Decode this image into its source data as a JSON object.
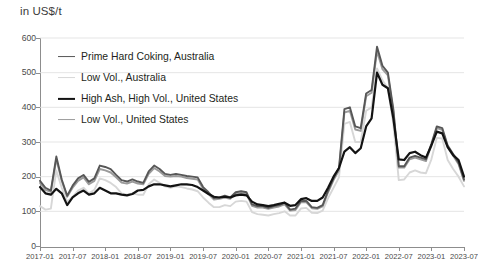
{
  "chart_data": {
    "type": "line",
    "title": "in US$/t",
    "xlabel": "",
    "ylabel": "in US$/t",
    "ylim": [
      0,
      600
    ],
    "ytick_step": 100,
    "yticks": [
      0,
      100,
      200,
      300,
      400,
      500,
      600
    ],
    "grid": true,
    "grid_axis": "y",
    "legend_position": "upper-left-inside",
    "x_tick_labels": [
      "2017-01",
      "2017-07",
      "2018-01",
      "2018-07",
      "2019-01",
      "2019-07",
      "2020-01",
      "2020-07",
      "2021-01",
      "2021-07",
      "2022-01",
      "2022-07",
      "2023-01",
      "2023-07"
    ],
    "x": [
      "2017-01",
      "2017-02",
      "2017-03",
      "2017-04",
      "2017-05",
      "2017-06",
      "2017-07",
      "2017-08",
      "2017-09",
      "2017-10",
      "2017-11",
      "2017-12",
      "2018-01",
      "2018-02",
      "2018-03",
      "2018-04",
      "2018-05",
      "2018-06",
      "2018-07",
      "2018-08",
      "2018-09",
      "2018-10",
      "2018-11",
      "2018-12",
      "2019-01",
      "2019-02",
      "2019-03",
      "2019-04",
      "2019-05",
      "2019-06",
      "2019-07",
      "2019-08",
      "2019-09",
      "2019-10",
      "2019-11",
      "2019-12",
      "2020-01",
      "2020-02",
      "2020-03",
      "2020-04",
      "2020-05",
      "2020-06",
      "2020-07",
      "2020-08",
      "2020-09",
      "2020-10",
      "2020-11",
      "2020-12",
      "2021-01",
      "2021-02",
      "2021-03",
      "2021-04",
      "2021-05",
      "2021-06",
      "2021-07",
      "2021-08",
      "2021-09",
      "2021-10",
      "2021-11",
      "2021-12",
      "2022-01",
      "2022-02",
      "2022-03",
      "2022-04",
      "2022-05",
      "2022-06",
      "2022-07",
      "2022-08",
      "2022-09",
      "2022-10",
      "2022-11",
      "2022-12",
      "2023-01",
      "2023-02",
      "2023-03",
      "2023-04",
      "2023-05",
      "2023-06",
      "2023-07"
    ],
    "series": [
      {
        "name": "Prime Hard Coking, Australia",
        "color": "#575757",
        "width": 1.9,
        "values": [
          188,
          168,
          160,
          258,
          192,
          145,
          174,
          195,
          205,
          185,
          195,
          232,
          228,
          222,
          205,
          190,
          186,
          192,
          186,
          182,
          215,
          232,
          222,
          208,
          205,
          208,
          205,
          202,
          200,
          198,
          170,
          155,
          138,
          140,
          145,
          140,
          155,
          158,
          155,
          120,
          115,
          115,
          110,
          115,
          118,
          125,
          105,
          108,
          130,
          130,
          112,
          110,
          118,
          160,
          195,
          225,
          395,
          400,
          345,
          340,
          440,
          450,
          575,
          520,
          500,
          395,
          230,
          230,
          255,
          260,
          255,
          250,
          295,
          345,
          340,
          290,
          265,
          240,
          192
        ]
      },
      {
        "name": "Low Vol., Australia",
        "color": "#d7d7d7",
        "width": 1.9,
        "values": [
          115,
          105,
          108,
          218,
          168,
          128,
          142,
          160,
          168,
          152,
          162,
          195,
          190,
          182,
          170,
          152,
          148,
          152,
          148,
          148,
          178,
          192,
          182,
          172,
          168,
          172,
          170,
          166,
          163,
          158,
          140,
          125,
          112,
          112,
          118,
          115,
          128,
          130,
          128,
          98,
          92,
          90,
          88,
          92,
          95,
          100,
          88,
          88,
          108,
          110,
          96,
          95,
          102,
          138,
          168,
          198,
          352,
          358,
          300,
          300,
          390,
          400,
          512,
          478,
          455,
          352,
          190,
          192,
          212,
          218,
          212,
          210,
          250,
          312,
          310,
          248,
          222,
          200,
          172
        ]
      },
      {
        "name": "High Ash, High Vol., United States",
        "color": "#131313",
        "width": 2.2,
        "values": [
          170,
          152,
          148,
          165,
          152,
          118,
          140,
          152,
          160,
          148,
          152,
          168,
          160,
          152,
          152,
          148,
          146,
          150,
          160,
          162,
          172,
          178,
          178,
          175,
          172,
          175,
          178,
          178,
          176,
          170,
          160,
          150,
          142,
          140,
          142,
          140,
          146,
          148,
          146,
          128,
          120,
          118,
          115,
          118,
          122,
          125,
          116,
          118,
          135,
          138,
          130,
          130,
          140,
          168,
          200,
          225,
          272,
          285,
          268,
          282,
          345,
          368,
          500,
          465,
          455,
          368,
          250,
          248,
          268,
          272,
          262,
          255,
          290,
          330,
          325,
          285,
          262,
          248,
          200
        ]
      },
      {
        "name": "Low Vol., United States",
        "color": "#9b9b9b",
        "width": 1.9,
        "values": [
          182,
          162,
          156,
          250,
          188,
          142,
          168,
          188,
          198,
          178,
          188,
          222,
          218,
          212,
          198,
          183,
          180,
          186,
          180,
          178,
          208,
          225,
          215,
          202,
          200,
          202,
          200,
          196,
          194,
          192,
          165,
          150,
          134,
          136,
          140,
          136,
          150,
          152,
          150,
          116,
          111,
          111,
          107,
          111,
          114,
          120,
          102,
          104,
          126,
          126,
          109,
          107,
          114,
          155,
          190,
          218,
          385,
          390,
          336,
          332,
          432,
          442,
          562,
          510,
          492,
          388,
          226,
          226,
          250,
          255,
          250,
          245,
          290,
          340,
          335,
          285,
          260,
          236,
          188
        ]
      }
    ]
  }
}
